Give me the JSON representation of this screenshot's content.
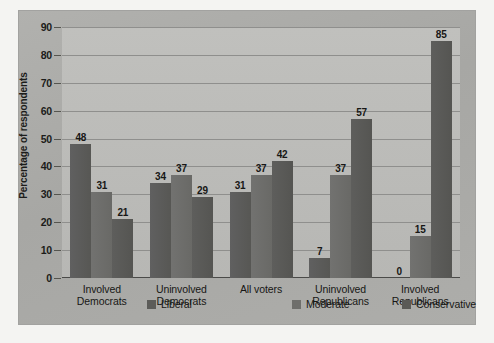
{
  "chart_data": {
    "type": "bar",
    "title": "",
    "xlabel": "",
    "ylabel": "Percentage of respondents",
    "ylim": [
      0,
      90
    ],
    "ytick_step": 10,
    "ytick_labels": [
      "0",
      "10",
      "20",
      "30",
      "40",
      "50",
      "60",
      "70",
      "80",
      "90"
    ],
    "grid": true,
    "legend_position": "bottom",
    "categories": [
      "Involved\nDemocrats",
      "Uninvolved\nDemocrats",
      "All voters",
      "Uninvolved\nRepublicans",
      "Involved\nRepublicans"
    ],
    "category_lines": [
      [
        "Involved",
        "Democrats"
      ],
      [
        "Uninvolved",
        "Democrats"
      ],
      [
        "All voters",
        ""
      ],
      [
        "Uninvolved",
        "Republicans"
      ],
      [
        "Involved",
        "Republicans"
      ]
    ],
    "series": [
      {
        "name": "Liberal",
        "color": "#5c5c59",
        "values": [
          48,
          34,
          31,
          7,
          0
        ]
      },
      {
        "name": "Moderate",
        "color": "#6e6e6b",
        "values": [
          31,
          37,
          37,
          37,
          15
        ]
      },
      {
        "name": "Conservative",
        "color": "#5a5a57",
        "values": [
          21,
          29,
          42,
          57,
          85
        ]
      }
    ],
    "data_labels": [
      [
        "48",
        "31",
        "21"
      ],
      [
        "34",
        "37",
        "29"
      ],
      [
        "31",
        "37",
        "42"
      ],
      [
        "7",
        "37",
        "57"
      ],
      [
        "0",
        "15",
        "85"
      ]
    ]
  },
  "colors": {
    "page_background": "#f4f4f2",
    "figure_panel": "#aaaaa8",
    "plot_background": "#bcbcb9",
    "gridline": "#8f8f8d",
    "axis": "#4a4a48",
    "text": "#17171a"
  }
}
